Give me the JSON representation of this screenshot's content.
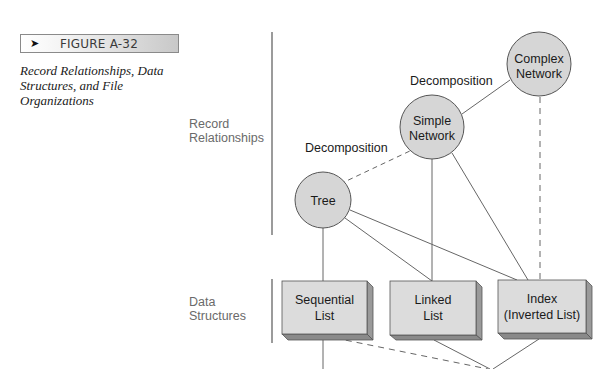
{
  "figure": {
    "arrow_icon": "➤",
    "label": "FIGURE A-32",
    "caption": "Record Relationships, Data Structures, and File Organizations"
  },
  "row_labels": {
    "record_relationships": [
      "Record",
      "Relationships"
    ],
    "data_structures": [
      "Data",
      "Structures"
    ]
  },
  "colors": {
    "node_fill": "#d6d6d6",
    "node_stroke": "#555555",
    "edge": "#666666",
    "box_front": "#dcdcdc",
    "box_side": "#9a9a9a",
    "box_bottom": "#8a8a8a"
  },
  "nodes": {
    "tree": {
      "label": [
        "Tree"
      ]
    },
    "simple_network": {
      "label": [
        "Simple",
        "Network"
      ]
    },
    "complex_network": {
      "label": [
        "Complex",
        "Network"
      ]
    },
    "sequential_list": {
      "label": [
        "Sequential",
        "List"
      ]
    },
    "linked_list": {
      "label": [
        "Linked",
        "List"
      ]
    },
    "index": {
      "label": [
        "Index",
        "(Inverted List)"
      ]
    }
  },
  "edge_labels": {
    "tree_to_simple": "Decomposition",
    "simple_to_complex": "Decomposition"
  },
  "edges": [
    {
      "from": "tree",
      "to": "simple_network",
      "style": "dashed",
      "label": "Decomposition"
    },
    {
      "from": "simple_network",
      "to": "complex_network",
      "style": "solid",
      "label": "Decomposition"
    },
    {
      "from": "tree",
      "to": "sequential_list",
      "style": "solid"
    },
    {
      "from": "tree",
      "to": "linked_list",
      "style": "solid"
    },
    {
      "from": "tree",
      "to": "index",
      "style": "solid"
    },
    {
      "from": "simple_network",
      "to": "linked_list",
      "style": "solid"
    },
    {
      "from": "simple_network",
      "to": "index",
      "style": "solid"
    },
    {
      "from": "complex_network",
      "to": "index",
      "style": "dashed"
    },
    {
      "from": "sequential_list",
      "to": "below",
      "style": "solid"
    },
    {
      "from": "sequential_list",
      "to": "below",
      "style": "dashed"
    },
    {
      "from": "linked_list",
      "to": "below",
      "style": "solid"
    },
    {
      "from": "index",
      "to": "below",
      "style": "solid"
    }
  ]
}
